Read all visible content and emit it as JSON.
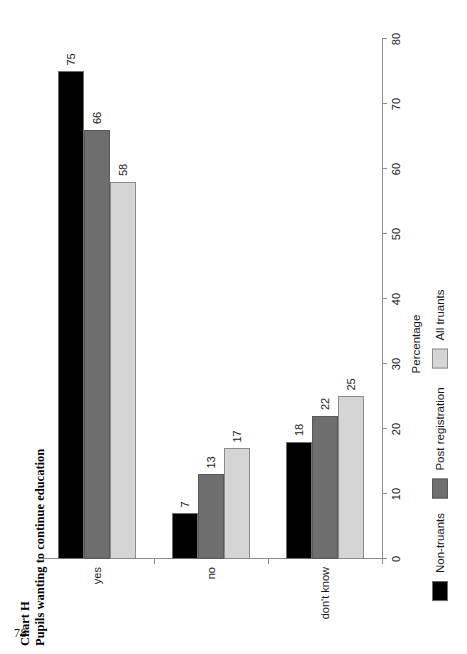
{
  "page": {
    "number": "78"
  },
  "figure": {
    "chart_id": "Chart H",
    "title": "Pupils wanting to continue education"
  },
  "chart_data": {
    "type": "bar",
    "orientation": "vertical-grouped",
    "title": "Pupils wanting to continue education",
    "subtitle": "Chart H",
    "xlabel": "",
    "ylabel": "Percentage",
    "ylim": [
      0,
      80
    ],
    "yticks": [
      0,
      10,
      20,
      30,
      40,
      50,
      60,
      70,
      80
    ],
    "ytick_labels": [
      "0",
      "10",
      "20",
      "30",
      "40",
      "50",
      "60",
      "70",
      "80"
    ],
    "grid": false,
    "legend_position": "bottom",
    "categories": [
      "yes",
      "no",
      "don't know"
    ],
    "series": [
      {
        "name": "Non-truants",
        "color": "#000000",
        "values": [
          75,
          7,
          18
        ],
        "value_labels": [
          "75",
          "7",
          "18"
        ]
      },
      {
        "name": "Post registration",
        "color": "#6e6e6e",
        "values": [
          66,
          13,
          22
        ],
        "value_labels": [
          "66",
          "13",
          "22"
        ]
      },
      {
        "name": "All truants",
        "color": "#d5d5d5",
        "values": [
          58,
          17,
          25
        ],
        "value_labels": [
          "58",
          "17",
          "25"
        ]
      }
    ]
  }
}
